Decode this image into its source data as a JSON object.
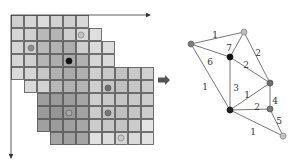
{
  "grid": {
    "origin": [
      11,
      15
    ],
    "cell": 13,
    "rows": [
      {
        "start": 0,
        "end": 5,
        "shades": [
          "#cfcfcf",
          "#d6d6d6",
          "#dcdcdc",
          "#d2d2d2",
          "#cfcfcf",
          "#d8d8d8"
        ]
      },
      {
        "start": 0,
        "end": 6,
        "shades": [
          "#d6d6d6",
          "#d0d0d0",
          "#b9b9b9",
          "#b5b5b5",
          "#cfcfcf",
          "#d9d9d9",
          "#dedede"
        ]
      },
      {
        "start": 0,
        "end": 7,
        "shades": [
          "#d4d4d4",
          "#cfcfcf",
          "#b8b8b8",
          "#b2b2b2",
          "#adadad",
          "#cfcfcf",
          "#dadada",
          "#dddddd"
        ]
      },
      {
        "start": 0,
        "end": 7,
        "shades": [
          "#d6d6d6",
          "#cfcfcf",
          "#b5b5b5",
          "#adadad",
          "#a9a9a9",
          "#b1b1b1",
          "#d6d6d6",
          "#dadada"
        ]
      },
      {
        "start": 0,
        "end": 10,
        "shades": [
          "#dadada",
          "#d5d5d5",
          "#c6c6c6",
          "#b1b1b1",
          "#aaaaaa",
          "#afafaf",
          "#cfcfcf",
          "#c8c8c8",
          "#c2c2c2",
          "#c9c9c9",
          "#cfcfcf"
        ]
      },
      {
        "start": 1,
        "end": 10,
        "shades": [
          "#dadada",
          "#d2d2d2",
          "#b7b7b7",
          "#b1b1b1",
          "#b4b4b4",
          "#cfcfcf",
          "#c6c6c6",
          "#c0c0c0",
          "#c6c6c6",
          "#cccccc"
        ]
      },
      {
        "start": 2,
        "end": 10,
        "shades": [
          "#9e9e9e",
          "#9a9a9a",
          "#9d9d9d",
          "#a6a6a6",
          "#cfcfcf",
          "#c9c9c9",
          "#c5c5c5",
          "#c9c9c9",
          "#cecece"
        ]
      },
      {
        "start": 2,
        "end": 10,
        "shades": [
          "#9a9a9a",
          "#959595",
          "#9b9b9b",
          "#a2a2a2",
          "#cbcbcb",
          "#c4c4c4",
          "#bfbfbf",
          "#c5c5c5",
          "#cdcdcd"
        ]
      },
      {
        "start": 2,
        "end": 10,
        "shades": [
          "#a0a0a0",
          "#9b9b9b",
          "#9f9f9f",
          "#a6a6a6",
          "#cccccc",
          "#c7c7c7",
          "#c4c4c4",
          "#cbcbcb",
          "#e3e3e3"
        ]
      },
      {
        "start": 3,
        "end": 10,
        "shades": [
          "#a4a4a4",
          "#a0a0a0",
          "#a5a5a5",
          "#e0e0e0",
          "#dcdcdc",
          "#d4d4d4",
          "#d9d9d9",
          "#e2e2e2"
        ]
      }
    ],
    "dots": [
      {
        "x": 81,
        "y": 35,
        "fill": "#c4c4c4",
        "stroke": "#8a8a8a",
        "r": 3
      },
      {
        "x": 31,
        "y": 48,
        "fill": "#8c8c8c",
        "stroke": "#777777",
        "r": 3
      },
      {
        "x": 69,
        "y": 61,
        "fill": "#111111",
        "stroke": "#111111",
        "r": 3
      },
      {
        "x": 108,
        "y": 88,
        "fill": "#6e6e6e",
        "stroke": "#5c5c5c",
        "r": 3
      },
      {
        "x": 69,
        "y": 113,
        "fill": "#a8a8a8",
        "stroke": "#666666",
        "r": 3
      },
      {
        "x": 108,
        "y": 113,
        "fill": "#7a7a7a",
        "stroke": "#5c5c5c",
        "r": 3
      },
      {
        "x": 121,
        "y": 138,
        "fill": "#c8c8c8",
        "stroke": "#888888",
        "r": 3
      }
    ],
    "x_axis": {
      "x1": 11,
      "y1": 15,
      "x2": 150,
      "y2": 15
    },
    "y_axis": {
      "x1": 11,
      "y1": 15,
      "x2": 11,
      "y2": 158
    }
  },
  "transition_arrow": {
    "x": 158,
    "y": 80,
    "color": "#555555"
  },
  "graph": {
    "nodes": [
      {
        "id": "top",
        "x": 244,
        "y": 32,
        "fill": "#bdbdbd",
        "stroke": "#888888"
      },
      {
        "id": "left",
        "x": 191,
        "y": 44,
        "fill": "#7d7d7d",
        "stroke": "#666666"
      },
      {
        "id": "center",
        "x": 230,
        "y": 57,
        "fill": "#111111",
        "stroke": "#111111"
      },
      {
        "id": "right-mid",
        "x": 270,
        "y": 83,
        "fill": "#6e6e6e",
        "stroke": "#555555"
      },
      {
        "id": "bottom",
        "x": 230,
        "y": 110,
        "fill": "#222222",
        "stroke": "#111111"
      },
      {
        "id": "right-low",
        "x": 270,
        "y": 109,
        "fill": "#7a7a7a",
        "stroke": "#555555"
      },
      {
        "id": "bottom-right",
        "x": 283,
        "y": 136,
        "fill": "#c4c4c4",
        "stroke": "#888888"
      }
    ],
    "edges": [
      {
        "from": "left",
        "to": "top",
        "weight": "1",
        "lx": 215,
        "ly": 35
      },
      {
        "from": "top",
        "to": "center",
        "weight": "7",
        "lx": 229,
        "ly": 48
      },
      {
        "from": "left",
        "to": "center",
        "weight": "6",
        "lx": 210,
        "ly": 62
      },
      {
        "from": "top",
        "to": "right-mid",
        "weight": "2",
        "lx": 258,
        "ly": 53
      },
      {
        "from": "center",
        "to": "right-mid",
        "weight": "2",
        "lx": 246,
        "ly": 65
      },
      {
        "from": "left",
        "to": "bottom",
        "weight": "1",
        "lx": 205,
        "ly": 87
      },
      {
        "from": "center",
        "to": "bottom",
        "weight": "3",
        "lx": 236,
        "ly": 88
      },
      {
        "from": "bottom",
        "to": "right-mid",
        "weight": "1",
        "lx": 247,
        "ly": 95
      },
      {
        "from": "bottom",
        "to": "right-low",
        "weight": "2",
        "lx": 257,
        "ly": 107
      },
      {
        "from": "right-mid",
        "to": "right-low",
        "weight": "4",
        "lx": 275,
        "ly": 101
      },
      {
        "from": "right-low",
        "to": "bottom-right",
        "weight": "5",
        "lx": 279,
        "ly": 121
      },
      {
        "from": "bottom",
        "to": "bottom-right",
        "weight": "1",
        "lx": 253,
        "ly": 132
      }
    ]
  }
}
